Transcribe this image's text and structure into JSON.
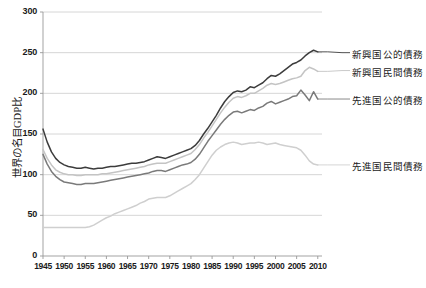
{
  "chart_data": {
    "type": "line",
    "title": "",
    "subtitle": "",
    "xlabel": "",
    "ylabel": "世界の名目GDP比",
    "xlim": [
      1945,
      2011
    ],
    "ylim": [
      0,
      300
    ],
    "grid": true,
    "legend_position": "right-inline",
    "x_ticks": [
      "1945",
      "1950",
      "1955",
      "1960",
      "1965",
      "1970",
      "1975",
      "1980",
      "1985",
      "1990",
      "1995",
      "2000",
      "2005",
      "2010"
    ],
    "x_tick_values": [
      1945,
      1950,
      1955,
      1960,
      1965,
      1970,
      1975,
      1980,
      1985,
      1990,
      1995,
      2000,
      2005,
      2010
    ],
    "y_ticks": [
      "0",
      "50",
      "100",
      "150",
      "200",
      "250",
      "300"
    ],
    "y_tick_values": [
      0,
      50,
      100,
      150,
      200,
      250,
      300
    ],
    "x": [
      1945,
      1946,
      1947,
      1948,
      1949,
      1950,
      1951,
      1952,
      1953,
      1954,
      1955,
      1956,
      1957,
      1958,
      1959,
      1960,
      1961,
      1962,
      1963,
      1964,
      1965,
      1966,
      1967,
      1968,
      1969,
      1970,
      1971,
      1972,
      1973,
      1974,
      1975,
      1976,
      1977,
      1978,
      1979,
      1980,
      1981,
      1982,
      1983,
      1984,
      1985,
      1986,
      1987,
      1988,
      1989,
      1990,
      1991,
      1992,
      1993,
      1994,
      1995,
      1996,
      1997,
      1998,
      1999,
      2000,
      2001,
      2002,
      2003,
      2004,
      2005,
      2006,
      2007,
      2008,
      2009,
      2010
    ],
    "series": [
      {
        "name": "新興国公的債務",
        "color": "#3c3c3c",
        "width": 1.5,
        "end_label_y": 250,
        "values": [
          156,
          140,
          128,
          120,
          115,
          112,
          110,
          109,
          108,
          108,
          109,
          108,
          107,
          108,
          108,
          109,
          110,
          110,
          111,
          112,
          113,
          114,
          114,
          115,
          116,
          118,
          120,
          122,
          121,
          120,
          122,
          124,
          126,
          128,
          130,
          132,
          136,
          142,
          150,
          157,
          165,
          173,
          182,
          190,
          196,
          201,
          203,
          202,
          204,
          208,
          207,
          210,
          213,
          218,
          222,
          221,
          224,
          228,
          232,
          236,
          238,
          241,
          246,
          250,
          253,
          251
        ]
      },
      {
        "name": "新興国民間債務",
        "color": "#c4c4c4",
        "width": 1.5,
        "end_label_y": 228,
        "values": [
          131,
          120,
          112,
          106,
          103,
          101,
          100,
          100,
          99,
          99,
          100,
          100,
          100,
          100,
          101,
          101,
          102,
          103,
          104,
          105,
          106,
          107,
          108,
          109,
          110,
          112,
          113,
          114,
          114,
          114,
          116,
          118,
          120,
          122,
          124,
          126,
          131,
          137,
          145,
          152,
          160,
          168,
          176,
          183,
          189,
          194,
          196,
          195,
          197,
          200,
          200,
          203,
          206,
          210,
          212,
          211,
          212,
          214,
          216,
          218,
          219,
          221,
          228,
          232,
          230,
          227
        ]
      },
      {
        "name": "先進国公的債務",
        "color": "#7a7a7a",
        "width": 1.5,
        "end_label_y": 193,
        "values": [
          125,
          113,
          104,
          98,
          94,
          91,
          90,
          89,
          88,
          88,
          89,
          89,
          89,
          90,
          91,
          92,
          93,
          94,
          95,
          96,
          97,
          98,
          99,
          100,
          101,
          102,
          104,
          105,
          105,
          104,
          106,
          108,
          110,
          112,
          113,
          115,
          119,
          125,
          133,
          141,
          148,
          155,
          162,
          168,
          173,
          177,
          178,
          176,
          178,
          180,
          179,
          182,
          184,
          188,
          190,
          187,
          189,
          191,
          193,
          196,
          197,
          204,
          198,
          191,
          202,
          193
        ]
      },
      {
        "name": "先進国民間債務",
        "color": "#cfcfcf",
        "width": 1.5,
        "end_label_y": 112,
        "values": [
          35,
          35,
          35,
          35,
          35,
          35,
          35,
          35,
          35,
          35,
          35,
          36,
          38,
          41,
          44,
          47,
          49,
          52,
          54,
          56,
          58,
          60,
          62,
          65,
          67,
          70,
          71,
          72,
          72,
          72,
          74,
          77,
          80,
          83,
          86,
          89,
          94,
          100,
          108,
          116,
          124,
          130,
          134,
          137,
          139,
          140,
          139,
          137,
          138,
          139,
          139,
          140,
          139,
          137,
          138,
          139,
          137,
          136,
          135,
          134,
          133,
          130,
          124,
          117,
          113,
          112
        ]
      }
    ]
  },
  "legend": [
    {
      "label": "新興国公的債務"
    },
    {
      "label": "新興国民間債務"
    },
    {
      "label": "先進国公的債務"
    },
    {
      "label": "先進国民間債務"
    }
  ],
  "axis": {
    "y_label": "世界の名目GDP比"
  },
  "colors": {
    "grid": "#cccccc",
    "axis": "#999999",
    "text": "#1a1a1a",
    "background": "#ffffff"
  }
}
